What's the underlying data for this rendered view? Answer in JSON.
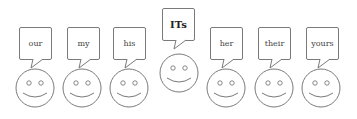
{
  "diagram": {
    "type": "speech-bubbles-over-smiley-faces",
    "stroke_color": "#7a7a7a",
    "background": "#ffffff",
    "items": [
      {
        "label": "our",
        "bubble_x": 19,
        "bubble_y": 27,
        "face_cx": 35,
        "face_cy": 88,
        "emphasized": false
      },
      {
        "label": "my",
        "bubble_x": 67,
        "bubble_y": 27,
        "face_cx": 82,
        "face_cy": 88,
        "emphasized": false
      },
      {
        "label": "his",
        "bubble_x": 113,
        "bubble_y": 27,
        "face_cx": 129,
        "face_cy": 88,
        "emphasized": false
      },
      {
        "label": "ITs",
        "bubble_x": 162,
        "bubble_y": 8,
        "face_cx": 179,
        "face_cy": 73,
        "emphasized": true
      },
      {
        "label": "her",
        "bubble_x": 210,
        "bubble_y": 27,
        "face_cx": 226,
        "face_cy": 88,
        "emphasized": false
      },
      {
        "label": "their",
        "bubble_x": 258,
        "bubble_y": 27,
        "face_cx": 274,
        "face_cy": 88,
        "emphasized": false
      },
      {
        "label": "yours",
        "bubble_x": 306,
        "bubble_y": 27,
        "face_cx": 321,
        "face_cy": 88,
        "emphasized": false
      }
    ]
  }
}
